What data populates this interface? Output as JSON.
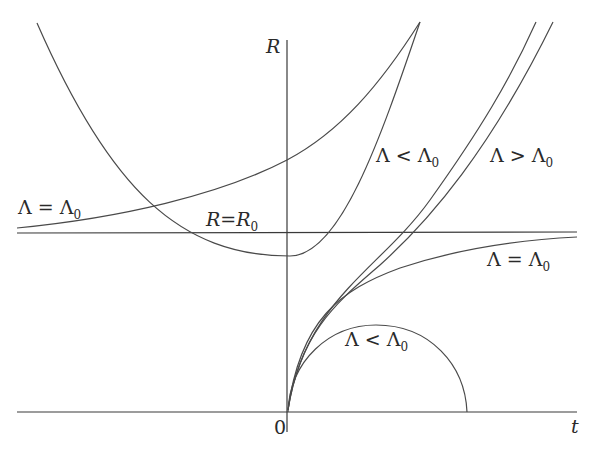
{
  "figure": {
    "axes": {
      "y_label": "R",
      "x_label": "t",
      "origin_label": "0"
    },
    "reference_line": {
      "label_lhs": "R",
      "label_op": "=",
      "label_rhs": "R",
      "label_sub": "0"
    },
    "labels": {
      "left_equal": {
        "lhs": "Λ",
        "op": "=",
        "rhs": "Λ",
        "sub": "0"
      },
      "upper_less": {
        "lhs": "Λ",
        "op": "<",
        "rhs": "Λ",
        "sub": "0"
      },
      "upper_greater": {
        "lhs": "Λ",
        "op": ">",
        "rhs": "Λ",
        "sub": "0"
      },
      "right_equal": {
        "lhs": "Λ",
        "op": "=",
        "rhs": "Λ",
        "sub": "0"
      },
      "arc_less": {
        "lhs": "Λ",
        "op": "<",
        "rhs": "Λ",
        "sub": "0"
      }
    },
    "curves": [
      "parabola with minimum below R=R0 (Λ=Λ0 side branch)",
      "rising curve crossing R-axis above R0 (Λ=Λ0, t<0 side)",
      "curve from origin approaching R0 asymptotically (Λ=Λ0)",
      "curve from origin rising steeply (Λ<Λ0 outer)",
      "curve from origin rising steeply (Λ>Λ0)",
      "semicircular arc from origin returning to t-axis (Λ<Λ0)"
    ]
  }
}
